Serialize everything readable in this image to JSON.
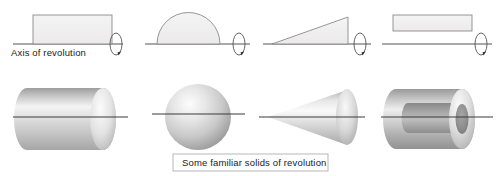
{
  "figure": {
    "axis_label": "Axis of revolution",
    "caption": "Some familiar solids of revolution",
    "background_color": "#ffffff",
    "outline_color": "#8a8a8a",
    "axis_color": "#555555",
    "text_color": "#1a1a1a",
    "caption_border_color": "#b0b0b0",
    "shape_fill_light": "#f2f2f2",
    "shape_fill_mid": "#d9d9d9",
    "shape_fill_dark": "#9a9a9a"
  },
  "top_row": {
    "row_name": "generating-plane-regions",
    "axis_y": 44,
    "items": [
      {
        "name": "rectangle-region",
        "shape": "rectangle",
        "label": "Rectangle",
        "rotation_marker": "rotation-arrow-icon",
        "touches_axis": true
      },
      {
        "name": "semicircle-region",
        "shape": "semicircle",
        "label": "Semicircle",
        "rotation_marker": "rotation-arrow-icon",
        "touches_axis": true
      },
      {
        "name": "right-triangle-region",
        "shape": "right-triangle",
        "label": "Right triangle",
        "rotation_marker": "rotation-arrow-icon",
        "touches_axis": true
      },
      {
        "name": "offset-rectangle-region",
        "shape": "rectangle",
        "label": "Offset rectangle",
        "rotation_marker": "rotation-arrow-icon",
        "touches_axis": false
      }
    ]
  },
  "bottom_row": {
    "row_name": "resulting-solids",
    "axis_y": 117,
    "items": [
      {
        "name": "cylinder-solid",
        "shape": "cylinder",
        "label": "Cylinder"
      },
      {
        "name": "sphere-solid",
        "shape": "sphere",
        "label": "Sphere"
      },
      {
        "name": "cone-solid",
        "shape": "cone",
        "label": "Cone"
      },
      {
        "name": "tube-solid",
        "shape": "hollow-tube",
        "label": "Hollow tube"
      }
    ]
  }
}
